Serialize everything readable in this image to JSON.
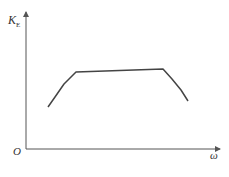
{
  "diagram": {
    "y_axis_label": "K",
    "y_axis_subscript": "E",
    "x_axis_label": "ω",
    "origin_label": "O",
    "curve_color": "#444444",
    "axis_color": "#555555",
    "curve_points": [
      [
        48,
        107
      ],
      [
        55,
        97
      ],
      [
        64,
        84
      ],
      [
        76,
        72
      ],
      [
        163,
        69
      ],
      [
        172,
        79
      ],
      [
        181,
        90
      ],
      [
        188,
        101
      ]
    ]
  }
}
